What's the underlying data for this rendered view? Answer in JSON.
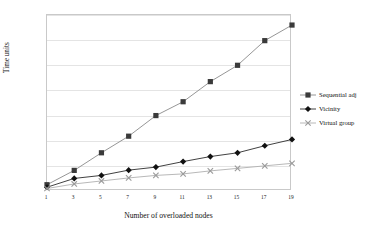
{
  "chart_data": {
    "type": "line",
    "title": "",
    "xlabel": "Number of overloaded nodes",
    "ylabel": "Time units",
    "x": [
      1,
      3,
      5,
      7,
      9,
      11,
      13,
      15,
      17,
      19
    ],
    "xtick_labels": [
      "1",
      "3",
      "5",
      "7",
      "9",
      "11",
      "13",
      "15",
      "17",
      "19"
    ],
    "ytick_labels": [
      "0",
      "100",
      "200",
      "300",
      "400",
      "500",
      "600",
      "700"
    ],
    "ytick_values": [
      0,
      100,
      200,
      300,
      400,
      500,
      600,
      700
    ],
    "xlim": [
      1,
      19
    ],
    "ylim": [
      0,
      700
    ],
    "grid": true,
    "legend_position": "right",
    "series": [
      {
        "name": "Sequential adj",
        "marker": "square",
        "color": "#3a3a3a",
        "line_color": "#8a8a8a",
        "values": [
          25,
          82,
          152,
          218,
          300,
          355,
          435,
          500,
          598,
          660
        ]
      },
      {
        "name": "Vicinity",
        "marker": "diamond",
        "color": "#111111",
        "line_color": "#2b2b2b",
        "values": [
          15,
          50,
          62,
          83,
          95,
          117,
          137,
          152,
          180,
          205
        ]
      },
      {
        "name": "Virtual group",
        "marker": "x",
        "color": "#9a9a9a",
        "line_color": "#b0b0b0",
        "values": [
          10,
          28,
          40,
          52,
          62,
          68,
          80,
          90,
          100,
          110
        ]
      }
    ]
  },
  "legend": {
    "items": [
      {
        "label": "Sequential adj",
        "marker": "square-marker-icon"
      },
      {
        "label": "Vicinity",
        "marker": "diamond-marker-icon"
      },
      {
        "label": "Virtual group",
        "marker": "x-marker-icon"
      }
    ]
  }
}
